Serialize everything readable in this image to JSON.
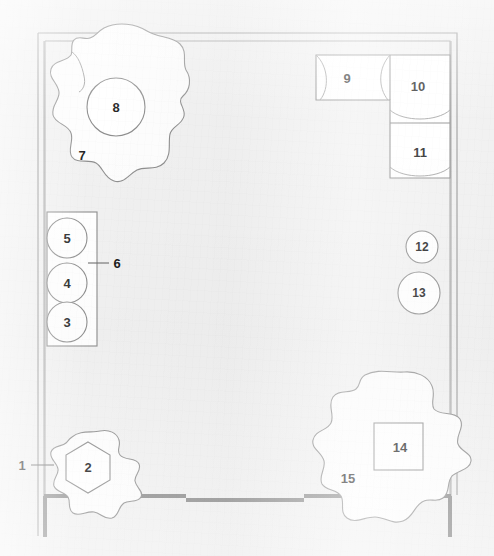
{
  "drawing": {
    "title": "Floor plan",
    "type": "architectural-plan",
    "canvas": {
      "width": 494,
      "height": 556
    },
    "background_color": "#f1f1f1",
    "line_color": "#8a8a8a",
    "wall_color": "#9a9a9a",
    "heavy_wall_color": "#8c8c8c",
    "label_color": "#1c1c1c",
    "fill_color": "#ffffff"
  },
  "walls": {
    "outer": {
      "x": 38,
      "y": 33,
      "width": 419,
      "height": 462,
      "note": "double-line thin wall"
    },
    "inner_offset": 6,
    "bottom_heavy": {
      "x1": 45,
      "y1": 496,
      "x2": 450,
      "y2": 496
    },
    "bottom_door_segment": {
      "x1": 185,
      "y1": 500,
      "x2": 303,
      "y2": 500
    },
    "left_stub": {
      "x": 45,
      "y1": 496,
      "y2": 536
    },
    "right_stub": {
      "x": 450,
      "y1": 496,
      "y2": 536
    }
  },
  "labels": [
    {
      "id": "1",
      "text": "1",
      "x": 22,
      "y": 465,
      "name": "label-1",
      "leader": {
        "x1": 32,
        "y1": 465,
        "x2": 52,
        "y2": 465
      }
    },
    {
      "id": "2",
      "text": "2",
      "x": 88,
      "y": 467,
      "name": "label-2"
    },
    {
      "id": "3",
      "text": "3",
      "x": 67,
      "y": 322,
      "name": "label-3"
    },
    {
      "id": "4",
      "text": "4",
      "x": 67,
      "y": 283,
      "name": "label-4"
    },
    {
      "id": "5",
      "text": "5",
      "x": 67,
      "y": 238,
      "name": "label-5"
    },
    {
      "id": "6",
      "text": "6",
      "x": 117,
      "y": 263,
      "name": "label-6",
      "leader": {
        "x1": 88,
        "y1": 263,
        "x2": 108,
        "y2": 263
      }
    },
    {
      "id": "7",
      "text": "7",
      "x": 82,
      "y": 155,
      "name": "label-7"
    },
    {
      "id": "8",
      "text": "8",
      "x": 116,
      "y": 107,
      "name": "label-8"
    },
    {
      "id": "9",
      "text": "9",
      "x": 347,
      "y": 78,
      "name": "label-9"
    },
    {
      "id": "10",
      "text": "10",
      "x": 418,
      "y": 86,
      "name": "label-10"
    },
    {
      "id": "11",
      "text": "11",
      "x": 420,
      "y": 152,
      "name": "label-11"
    },
    {
      "id": "12",
      "text": "12",
      "x": 422,
      "y": 247,
      "name": "label-12"
    },
    {
      "id": "13",
      "text": "13",
      "x": 419,
      "y": 293,
      "name": "label-13"
    },
    {
      "id": "14",
      "text": "14",
      "x": 400,
      "y": 447,
      "name": "label-14"
    },
    {
      "id": "15",
      "text": "15",
      "x": 348,
      "y": 478,
      "name": "label-15"
    }
  ],
  "elements": {
    "planter_bottom_left": {
      "label": "2",
      "shape": "hexagon",
      "cx": 88,
      "cy": 467,
      "radius": 25
    },
    "foliage_bottom_left": {
      "label": "",
      "shape": "organic-blob",
      "cx": 90,
      "cy": 464
    },
    "seat_row_left": {
      "label": "6",
      "shape": "rectangle",
      "x": 47,
      "y": 212,
      "width": 50,
      "height": 134,
      "circles": [
        {
          "label": "5",
          "cx": 67,
          "cy": 238,
          "r": 20
        },
        {
          "label": "4",
          "cx": 67,
          "cy": 283,
          "r": 20
        },
        {
          "label": "3",
          "cx": 67,
          "cy": 322,
          "r": 20
        }
      ]
    },
    "tree_top_left": {
      "label": "7",
      "shape": "organic-blob",
      "cx": 120,
      "cy": 105
    },
    "tree_trunk_top_left": {
      "label": "8",
      "shape": "circle",
      "cx": 116,
      "cy": 107,
      "r": 29
    },
    "sofa_left_segment": {
      "label": "9",
      "shape": "rectangle-with-arc",
      "x": 316,
      "y": 55,
      "width": 74,
      "height": 45
    },
    "sofa_corner": {
      "label": "10",
      "shape": "rectangle-with-arc",
      "x": 390,
      "y": 55,
      "width": 62,
      "height": 68
    },
    "sofa_lower_segment": {
      "label": "11",
      "shape": "rectangle-with-arc",
      "x": 390,
      "y": 123,
      "width": 62,
      "height": 55
    },
    "stool_small": {
      "label": "12",
      "shape": "circle",
      "cx": 422,
      "cy": 247,
      "r": 16
    },
    "stool_large": {
      "label": "13",
      "shape": "circle",
      "cx": 419,
      "cy": 293,
      "r": 21
    },
    "table_bottom_right": {
      "label": "14",
      "shape": "square",
      "x": 374,
      "y": 423,
      "width": 49,
      "height": 47
    },
    "foliage_bottom_right": {
      "label": "15",
      "shape": "organic-blob",
      "cx": 392,
      "cy": 448
    }
  }
}
